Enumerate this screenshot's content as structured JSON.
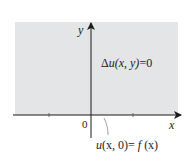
{
  "diagram": {
    "region": {
      "fill": "#e3e5e6",
      "description": "upper half-plane"
    },
    "axes": {
      "x_label": "x",
      "y_label": "y",
      "origin_label": "0"
    },
    "equation": {
      "delta": "Δ",
      "u": "u",
      "args": "(x, y)",
      "rhs": "=0"
    },
    "boundary_condition": {
      "u": "u",
      "args": "(x, 0)",
      "eq": "= ",
      "f": "f",
      "fargs": " (x)"
    }
  }
}
